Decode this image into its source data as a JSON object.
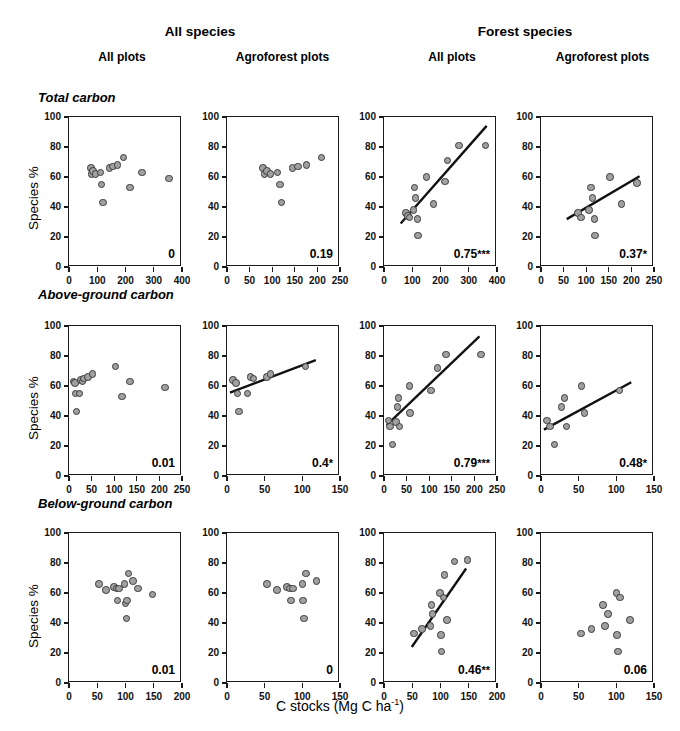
{
  "figure": {
    "xlabel_main": "C stocks (Mg C ha",
    "xlabel_sup": "-1",
    "xlabel_close": ")",
    "ylabel": "Species %"
  },
  "group_headers": [
    {
      "label": "All species"
    },
    {
      "label": "Forest species"
    }
  ],
  "column_headers": [
    {
      "label": "All plots"
    },
    {
      "label": "Agroforest plots"
    },
    {
      "label": "All plots"
    },
    {
      "label": "Agroforest plots"
    }
  ],
  "row_titles": [
    {
      "label": "Total carbon"
    },
    {
      "label": "Above-ground carbon"
    },
    {
      "label": "Below-ground carbon"
    }
  ],
  "yaxis": {
    "min": 0,
    "max": 100,
    "ticks": [
      0,
      20,
      40,
      60,
      80,
      100
    ],
    "ticklabels": [
      "0",
      "20",
      "40",
      "60",
      "80",
      "100"
    ]
  },
  "chart_data": {
    "type": "scatter",
    "title": "",
    "xlabel": "C stocks (Mg C ha-1)",
    "ylabel": "Species %",
    "ylim": [
      0,
      100
    ],
    "grid": false,
    "legend": "none",
    "marker_fill": "#a0a0a0",
    "marker_edge": "#3a3a3a",
    "fit_color": "#111111",
    "panels": [
      {
        "row": "Total carbon",
        "column": "All species / All plots",
        "r2": "0",
        "stars": "",
        "xlim": [
          0,
          400
        ],
        "xticks": [
          0,
          100,
          200,
          300,
          400
        ],
        "xticklabels": [
          "0",
          "100",
          "200",
          "300",
          "400"
        ],
        "fit": null,
        "points": [
          [
            78,
            66
          ],
          [
            80,
            62
          ],
          [
            86,
            64
          ],
          [
            94,
            62
          ],
          [
            112,
            63
          ],
          [
            115,
            55
          ],
          [
            120,
            43
          ],
          [
            143,
            66
          ],
          [
            155,
            67
          ],
          [
            172,
            68
          ],
          [
            193,
            73
          ],
          [
            215,
            53
          ],
          [
            258,
            63
          ],
          [
            355,
            59
          ]
        ]
      },
      {
        "row": "Total carbon",
        "column": "All species / Agroforest plots",
        "r2": "0.19",
        "stars": "",
        "xlim": [
          0,
          250
        ],
        "xticks": [
          0,
          50,
          100,
          150,
          200,
          250
        ],
        "xticklabels": [
          "0",
          "50",
          "100",
          "150",
          "200",
          "250"
        ],
        "fit": null,
        "points": [
          [
            80,
            66
          ],
          [
            83,
            62
          ],
          [
            88,
            64
          ],
          [
            96,
            62
          ],
          [
            112,
            63
          ],
          [
            117,
            55
          ],
          [
            121,
            43
          ],
          [
            145,
            66
          ],
          [
            157,
            67
          ],
          [
            176,
            68
          ],
          [
            209,
            73
          ]
        ]
      },
      {
        "row": "Total carbon",
        "column": "Forest species / All plots",
        "r2": "0.75",
        "stars": "***",
        "xlim": [
          0,
          400
        ],
        "xticks": [
          0,
          100,
          200,
          300,
          400
        ],
        "xticklabels": [
          "0",
          "100",
          "200",
          "300",
          "400"
        ],
        "fit": {
          "x1": 60,
          "y1": 28,
          "x2": 370,
          "y2": 94
        },
        "points": [
          [
            78,
            36
          ],
          [
            84,
            34
          ],
          [
            90,
            33
          ],
          [
            104,
            38
          ],
          [
            108,
            53
          ],
          [
            112,
            46
          ],
          [
            118,
            32
          ],
          [
            120,
            21
          ],
          [
            150,
            60
          ],
          [
            175,
            42
          ],
          [
            215,
            57
          ],
          [
            225,
            71
          ],
          [
            265,
            81
          ],
          [
            360,
            81
          ]
        ]
      },
      {
        "row": "Total carbon",
        "column": "Forest species / Agroforest plots",
        "r2": "0.37",
        "stars": "*",
        "xlim": [
          0,
          250
        ],
        "xticks": [
          0,
          50,
          100,
          150,
          200,
          250
        ],
        "xticklabels": [
          "0",
          "50",
          "100",
          "150",
          "200",
          "250"
        ],
        "fit": {
          "x1": 58,
          "y1": 31,
          "x2": 222,
          "y2": 60
        },
        "points": [
          [
            82,
            36
          ],
          [
            88,
            33
          ],
          [
            106,
            38
          ],
          [
            110,
            53
          ],
          [
            114,
            46
          ],
          [
            118,
            32
          ],
          [
            120,
            21
          ],
          [
            153,
            60
          ],
          [
            178,
            42
          ],
          [
            212,
            56
          ]
        ]
      },
      {
        "row": "Above-ground carbon",
        "column": "All species / All plots",
        "r2": "0.01",
        "stars": "",
        "xlim": [
          0,
          250
        ],
        "xticks": [
          0,
          50,
          100,
          150,
          200,
          250
        ],
        "xticklabels": [
          "0",
          "50",
          "100",
          "150",
          "200",
          "250"
        ],
        "fit": null,
        "points": [
          [
            10,
            63
          ],
          [
            13,
            62
          ],
          [
            14,
            55
          ],
          [
            17,
            43
          ],
          [
            23,
            55
          ],
          [
            27,
            64
          ],
          [
            30,
            63
          ],
          [
            33,
            65
          ],
          [
            42,
            66
          ],
          [
            52,
            68
          ],
          [
            103,
            73
          ],
          [
            117,
            53
          ],
          [
            135,
            63
          ],
          [
            212,
            59
          ]
        ]
      },
      {
        "row": "Above-ground carbon",
        "column": "All species / Agroforest plots",
        "r2": "0.4",
        "stars": "*",
        "xlim": [
          0,
          150
        ],
        "xticks": [
          0,
          50,
          100,
          150
        ],
        "xticklabels": [
          "0",
          "50",
          "100",
          "150"
        ],
        "fit": {
          "x1": 4,
          "y1": 55,
          "x2": 120,
          "y2": 77
        },
        "points": [
          [
            8,
            64
          ],
          [
            12,
            62
          ],
          [
            14,
            55
          ],
          [
            16,
            43
          ],
          [
            27,
            55
          ],
          [
            31,
            66
          ],
          [
            35,
            65
          ],
          [
            53,
            66
          ],
          [
            58,
            68
          ],
          [
            104,
            73
          ]
        ]
      },
      {
        "row": "Above-ground carbon",
        "column": "Forest species / All plots",
        "r2": "0.79",
        "stars": "***",
        "xlim": [
          0,
          250
        ],
        "xticks": [
          0,
          50,
          100,
          150,
          200,
          250
        ],
        "xticklabels": [
          "0",
          "50",
          "100",
          "150",
          "200",
          "250"
        ],
        "fit": {
          "x1": 6,
          "y1": 33,
          "x2": 215,
          "y2": 93
        },
        "points": [
          [
            10,
            37
          ],
          [
            13,
            33
          ],
          [
            19,
            21
          ],
          [
            26,
            36
          ],
          [
            30,
            46
          ],
          [
            32,
            52
          ],
          [
            34,
            33
          ],
          [
            56,
            60
          ],
          [
            58,
            42
          ],
          [
            104,
            57
          ],
          [
            118,
            72
          ],
          [
            137,
            81
          ],
          [
            215,
            81
          ]
        ]
      },
      {
        "row": "Above-ground carbon",
        "column": "Forest species / Agroforest plots",
        "r2": "0.48",
        "stars": "*",
        "xlim": [
          0,
          150
        ],
        "xticks": [
          0,
          50,
          100,
          150
        ],
        "xticklabels": [
          "0",
          "50",
          "100",
          "150"
        ],
        "fit": {
          "x1": 4,
          "y1": 30,
          "x2": 122,
          "y2": 62
        },
        "points": [
          [
            8,
            37
          ],
          [
            12,
            33
          ],
          [
            18,
            21
          ],
          [
            27,
            46
          ],
          [
            31,
            52
          ],
          [
            34,
            33
          ],
          [
            54,
            60
          ],
          [
            58,
            42
          ],
          [
            104,
            57
          ]
        ]
      },
      {
        "row": "Below-ground carbon",
        "column": "All species / All plots",
        "r2": "0.01",
        "stars": "",
        "xlim": [
          0,
          200
        ],
        "xticks": [
          0,
          50,
          100,
          150,
          200
        ],
        "xticklabels": [
          "0",
          "50",
          "100",
          "150",
          "200"
        ],
        "fit": null,
        "points": [
          [
            53,
            66
          ],
          [
            66,
            62
          ],
          [
            80,
            64
          ],
          [
            84,
            63
          ],
          [
            86,
            55
          ],
          [
            88,
            63
          ],
          [
            98,
            66
          ],
          [
            100,
            53
          ],
          [
            102,
            43
          ],
          [
            103,
            55
          ],
          [
            105,
            73
          ],
          [
            113,
            68
          ],
          [
            122,
            63
          ],
          [
            148,
            59
          ]
        ]
      },
      {
        "row": "Below-ground carbon",
        "column": "All species / Agroforest plots",
        "r2": "0",
        "stars": "",
        "xlim": [
          0,
          150
        ],
        "xticks": [
          0,
          50,
          100,
          150
        ],
        "xticklabels": [
          "0",
          "50",
          "100",
          "150"
        ],
        "fit": null,
        "points": [
          [
            53,
            66
          ],
          [
            66,
            62
          ],
          [
            80,
            64
          ],
          [
            84,
            63
          ],
          [
            85,
            55
          ],
          [
            88,
            63
          ],
          [
            100,
            66
          ],
          [
            101,
            55
          ],
          [
            102,
            43
          ],
          [
            105,
            73
          ],
          [
            119,
            68
          ]
        ]
      },
      {
        "row": "Below-ground carbon",
        "column": "Forest species / All plots",
        "r2": "0.46",
        "stars": "**",
        "xlim": [
          0,
          200
        ],
        "xticks": [
          0,
          50,
          100,
          150,
          200
        ],
        "xticklabels": [
          "0",
          "50",
          "100",
          "150",
          "200"
        ],
        "fit": {
          "x1": 50,
          "y1": 23,
          "x2": 148,
          "y2": 76
        },
        "points": [
          [
            53,
            33
          ],
          [
            67,
            36
          ],
          [
            82,
            38
          ],
          [
            84,
            52
          ],
          [
            86,
            46
          ],
          [
            99,
            60
          ],
          [
            101,
            32
          ],
          [
            102,
            21
          ],
          [
            105,
            57
          ],
          [
            107,
            72
          ],
          [
            112,
            42
          ],
          [
            125,
            81
          ],
          [
            148,
            82
          ]
        ]
      },
      {
        "row": "Below-ground carbon",
        "column": "Forest species / Agroforest plots",
        "r2": "0.06",
        "stars": "",
        "xlim": [
          0,
          150
        ],
        "xticks": [
          0,
          50,
          100,
          150
        ],
        "xticklabels": [
          "0",
          "50",
          "100",
          "150"
        ],
        "fit": null,
        "points": [
          [
            53,
            33
          ],
          [
            67,
            36
          ],
          [
            82,
            52
          ],
          [
            85,
            38
          ],
          [
            89,
            46
          ],
          [
            100,
            60
          ],
          [
            101,
            32
          ],
          [
            102,
            21
          ],
          [
            105,
            57
          ],
          [
            118,
            42
          ]
        ]
      }
    ]
  }
}
